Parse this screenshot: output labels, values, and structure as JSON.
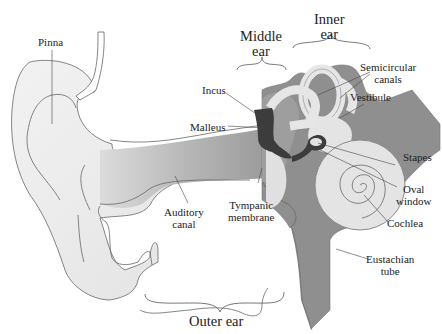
{
  "diagram": {
    "regions": {
      "outer": "Outer ear",
      "middle_line1": "Middle",
      "middle_line2": "ear",
      "inner_line1": "Inner",
      "inner_line2": "ear"
    },
    "labels": {
      "pinna": "Pinna",
      "incus": "Incus",
      "malleus": "Malleus",
      "semicircular_1": "Semicircular",
      "semicircular_2": "canals",
      "vestibule": "Vestibule",
      "stapes": "Stapes",
      "oval_1": "Oval",
      "oval_2": "window",
      "cochlea": "Cochlea",
      "eustachian_1": "Eustachian",
      "eustachian_2": "tube",
      "tympanic_1": "Tympanic",
      "tympanic_2": "membrane",
      "auditory_1": "Auditory",
      "auditory_2": "canal"
    },
    "colors": {
      "outline": "#555555",
      "skin_light": "#e6e6e6",
      "canal_gray": "#a8a8a8",
      "bone_gray": "#8f8f8f",
      "ossicle_dark": "#3c3c3c",
      "labyrinth": "#e4e4e4"
    }
  }
}
